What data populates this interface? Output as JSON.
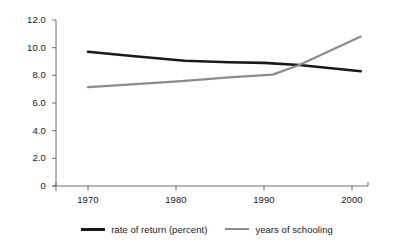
{
  "chart_data": {
    "type": "line",
    "title": "",
    "subtitle": "",
    "xlabel": "",
    "ylabel": "",
    "xlim": [
      1968,
      2002
    ],
    "ylim": [
      0,
      12
    ],
    "grid": false,
    "legend_position": "bottom",
    "x_ticks": [
      "1970",
      "1980",
      "1990",
      "2000"
    ],
    "x_tick_values": [
      1970,
      1980,
      1990,
      2000
    ],
    "y_ticks": [
      "12.0",
      "10.0",
      "8.0",
      "6.0",
      "4.0",
      "2.0",
      "0"
    ],
    "y_tick_values": [
      12.0,
      10.0,
      8.0,
      6.0,
      4.0,
      2.0,
      0
    ],
    "series": [
      {
        "name": "rate of return (percent)",
        "color": "#1a1a1a",
        "width": 2.6,
        "x": [
          1970,
          1975,
          1981,
          1986,
          1990,
          1994,
          2001
        ],
        "values": [
          9.7,
          9.4,
          9.05,
          8.95,
          8.9,
          8.75,
          8.3
        ]
      },
      {
        "name": "years of schooling",
        "color": "#8c8c8c",
        "width": 2.2,
        "x": [
          1970,
          1975,
          1981,
          1986,
          1991,
          1994,
          2001
        ],
        "values": [
          7.15,
          7.35,
          7.6,
          7.85,
          8.05,
          8.75,
          10.8
        ]
      }
    ]
  },
  "axis": {
    "line_color": "#6e6e6e"
  },
  "legend": {
    "entries": [
      {
        "label": "rate of return (percent)",
        "color": "#1a1a1a"
      },
      {
        "label": "years of schooling",
        "color": "#8c8c8c"
      }
    ]
  }
}
